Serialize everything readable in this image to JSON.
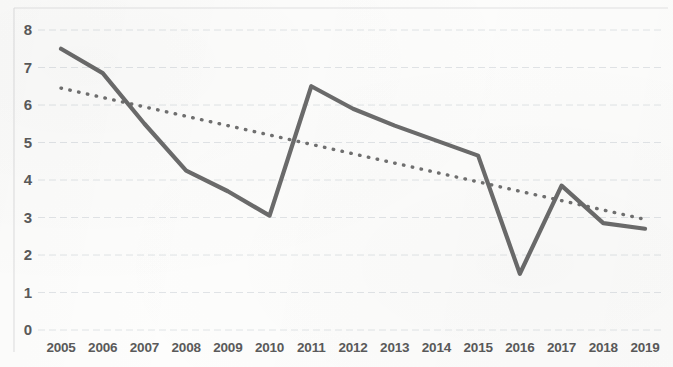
{
  "chart_data": {
    "type": "line",
    "title": "",
    "subtitle": "",
    "xlabel": "",
    "ylabel": "",
    "categories": [
      "2005",
      "2006",
      "2007",
      "2008",
      "2009",
      "2010",
      "2011",
      "2012",
      "2013",
      "2014",
      "2015",
      "2016",
      "2017",
      "2018",
      "2019"
    ],
    "series": [
      {
        "name": "data",
        "style": "solid",
        "color": "#6b6b6b",
        "values": [
          7.5,
          6.85,
          5.5,
          4.25,
          3.7,
          3.05,
          6.5,
          5.9,
          5.45,
          5.05,
          4.65,
          1.5,
          3.85,
          2.85,
          2.7
        ]
      },
      {
        "name": "trendline",
        "style": "dotted",
        "color": "#707070",
        "values": [
          6.45,
          6.2,
          5.95,
          5.7,
          5.45,
          5.2,
          4.95,
          4.7,
          4.45,
          4.2,
          3.95,
          3.7,
          3.45,
          3.2,
          2.95
        ]
      }
    ],
    "ylim": [
      0,
      8
    ],
    "yticks": [
      0,
      1,
      2,
      3,
      4,
      5,
      6,
      7,
      8
    ],
    "ytick_labels": [
      "0",
      "1",
      "2",
      "3",
      "4",
      "5",
      "6",
      "7",
      "8"
    ],
    "grid": true,
    "grid_axis": "y",
    "grid_style": "dashed",
    "legend": "none",
    "legend_position": "none",
    "annotations": []
  },
  "style": {
    "line_color": "#6b6b6b",
    "trend_color": "#707070",
    "grid_color": "#d8dce0",
    "text_color": "#5a5a5a",
    "background": "#fdfdfc",
    "border_color": "#e2e2e2"
  }
}
